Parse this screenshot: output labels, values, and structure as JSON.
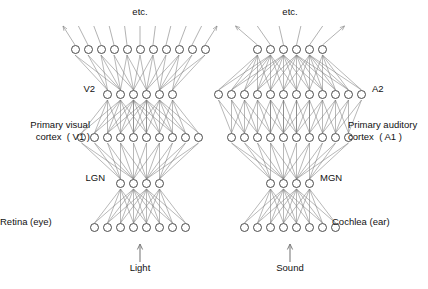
{
  "figure": {
    "stroke_color": "#7d7d7d",
    "node_stroke_color": "#4a4a4a",
    "text_color": "#111111",
    "background": "#ffffff"
  },
  "columns": [
    {
      "id": "visual",
      "name": "visual-pathway",
      "center_x": 140,
      "input": {
        "label": "Light",
        "arrow": "up-arrow",
        "x": 140,
        "label_y": 268,
        "arrow_top": 244,
        "arrow_bottom": 262
      },
      "top_label": {
        "text": "etc.",
        "x": 140,
        "y": 12
      },
      "layers": [
        {
          "id": "retina",
          "label": "Retina (eye)",
          "label_pos": "left",
          "label_x": 34,
          "label_y": 222,
          "count": 8,
          "spacing": 13,
          "y": 228
        },
        {
          "id": "lgn",
          "label": "LGN",
          "label_pos": "left",
          "label_x": 105,
          "label_y": 178,
          "count": 4,
          "spacing": 13,
          "y": 184
        },
        {
          "id": "v1",
          "label": "Primary visual\ncortex  ( V1 )",
          "label_pos": "left",
          "label_x": 90,
          "label_y": 125,
          "count": 10,
          "spacing": 13,
          "y": 138
        },
        {
          "id": "v2",
          "label": "V2",
          "label_pos": "left",
          "label_x": 95,
          "label_y": 89,
          "count": 6,
          "spacing": 13,
          "y": 95
        },
        {
          "id": "etc",
          "label": "",
          "label_pos": "none",
          "label_x": 0,
          "label_y": 0,
          "count": 11,
          "spacing": 13,
          "y": 50
        }
      ]
    },
    {
      "id": "auditory",
      "name": "auditory-pathway",
      "center_x": 290,
      "input": {
        "label": "Sound",
        "arrow": "up-arrow",
        "x": 290,
        "label_y": 268,
        "arrow_top": 244,
        "arrow_bottom": 262
      },
      "top_label": {
        "text": "etc.",
        "x": 290,
        "y": 12
      },
      "layers": [
        {
          "id": "cochlea",
          "label": "Cochlea (ear)",
          "label_pos": "right",
          "label_x": 332,
          "label_y": 222,
          "count": 8,
          "spacing": 13,
          "y": 228
        },
        {
          "id": "mgn",
          "label": "MGN",
          "label_pos": "right",
          "label_x": 320,
          "label_y": 178,
          "count": 4,
          "spacing": 13,
          "y": 184
        },
        {
          "id": "a1",
          "label": "Primary auditory\ncortex  ( A1 )",
          "label_pos": "right",
          "label_x": 348,
          "label_y": 125,
          "count": 10,
          "spacing": 13,
          "y": 138
        },
        {
          "id": "a2",
          "label": "A2",
          "label_pos": "right",
          "label_x": 372,
          "label_y": 89,
          "count": 12,
          "spacing": 13,
          "y": 95
        },
        {
          "id": "etc",
          "label": "",
          "label_pos": "none",
          "label_x": 0,
          "label_y": 0,
          "count": 6,
          "spacing": 13,
          "y": 50
        }
      ]
    }
  ],
  "connections": [
    {
      "from": "retina",
      "to": "lgn",
      "column": "visual"
    },
    {
      "from": "lgn",
      "to": "v1",
      "column": "visual"
    },
    {
      "from": "v1",
      "to": "v2",
      "column": "visual"
    },
    {
      "from": "v2",
      "to": "etc",
      "column": "visual"
    },
    {
      "from": "cochlea",
      "to": "mgn",
      "column": "auditory"
    },
    {
      "from": "mgn",
      "to": "a1",
      "column": "auditory"
    },
    {
      "from": "a1",
      "to": "a2",
      "column": "auditory"
    },
    {
      "from": "a2",
      "to": "etc",
      "column": "auditory"
    }
  ],
  "top_fanout": {
    "visual": {
      "from_layer": "etc",
      "y_top": 26,
      "spread": 12,
      "arrow_ends": true
    },
    "auditory": {
      "from_layer": "etc",
      "y_top": 26,
      "spread": 22,
      "arrow_ends": true
    }
  }
}
